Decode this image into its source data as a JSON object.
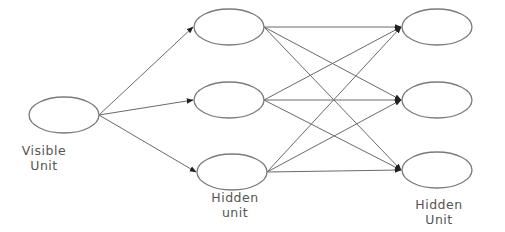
{
  "diagram": {
    "type": "neural-network",
    "colors": {
      "stroke": "#7a7a7a",
      "edge": "#6a6a6a",
      "arrowhead": "#222222",
      "text": "#555555",
      "background": "#ffffff"
    },
    "layers": [
      {
        "id": "visible",
        "label_line1": "Visible",
        "label_line2": "Unit",
        "nodes": [
          {
            "id": "v1",
            "cx": 64,
            "cy": 115
          }
        ]
      },
      {
        "id": "hidden1",
        "label_line1": "Hidden",
        "label_line2": "unit",
        "nodes": [
          {
            "id": "h1",
            "cx": 229,
            "cy": 27
          },
          {
            "id": "h2",
            "cx": 229,
            "cy": 100
          },
          {
            "id": "h3",
            "cx": 232,
            "cy": 172
          }
        ]
      },
      {
        "id": "hidden2",
        "label_line1": "Hidden",
        "label_line2": "Unit",
        "nodes": [
          {
            "id": "o1",
            "cx": 437,
            "cy": 27
          },
          {
            "id": "o2",
            "cx": 437,
            "cy": 100
          },
          {
            "id": "o3",
            "cx": 437,
            "cy": 170
          }
        ]
      }
    ],
    "edges": [
      [
        "v1",
        "h1"
      ],
      [
        "v1",
        "h2"
      ],
      [
        "v1",
        "h3"
      ],
      [
        "h1",
        "o1"
      ],
      [
        "h1",
        "o2"
      ],
      [
        "h1",
        "o3"
      ],
      [
        "h2",
        "o1"
      ],
      [
        "h2",
        "o2"
      ],
      [
        "h2",
        "o3"
      ],
      [
        "h3",
        "o1"
      ],
      [
        "h3",
        "o2"
      ],
      [
        "h3",
        "o3"
      ]
    ]
  }
}
